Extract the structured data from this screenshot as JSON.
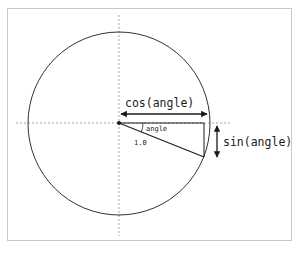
{
  "diagram": {
    "labels": {
      "cos": "cos(angle)",
      "sin": "sin(angle)",
      "angle": "angle",
      "radius": "1.0"
    },
    "geometry": {
      "center": [
        119,
        123
      ],
      "radius": 91,
      "point_on_circle": [
        204,
        157
      ]
    },
    "colors": {
      "stroke": "#1a1a1a",
      "dashed_axis": "#8a8a8a",
      "frame_border": "#c8c8c8",
      "background": "#ffffff"
    }
  }
}
